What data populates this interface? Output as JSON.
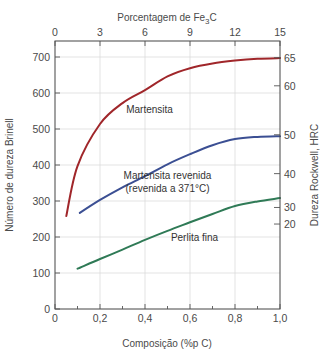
{
  "chart_data": {
    "type": "line",
    "title": "",
    "top_axis": {
      "label": "Porcentagem de Fe3C",
      "label_main": "Porcentagem de Fe",
      "label_sub": "3",
      "label_tail": "C",
      "ticks": [
        0,
        3,
        6,
        9,
        12,
        15
      ],
      "tick_labels": [
        "0",
        "3",
        "6",
        "9",
        "12",
        "15"
      ],
      "range": [
        0,
        15
      ]
    },
    "xlabel": "Composição (%p C)",
    "x_ticks": [
      0,
      0.2,
      0.4,
      0.6,
      0.8,
      1.0
    ],
    "x_tick_labels": [
      "0",
      "0,2",
      "0,4",
      "0,6",
      "0,8",
      "1,0"
    ],
    "x_minor_ticks": [
      0.1,
      0.3,
      0.5,
      0.7,
      0.9
    ],
    "xlim": [
      0,
      1.0
    ],
    "ylabel": "Número de dureza Brinell",
    "y_ticks": [
      0,
      100,
      200,
      300,
      400,
      500,
      600,
      700
    ],
    "y_tick_labels": [
      "0",
      "100",
      "200",
      "300",
      "400",
      "500",
      "600",
      "700"
    ],
    "ylim": [
      0,
      700
    ],
    "right_axis": {
      "label": "Dureza Rockwell, HRC",
      "ticks": [
        {
          "label": "65",
          "brinell": 698
        },
        {
          "label": "60",
          "brinell": 620
        },
        {
          "label": "50",
          "brinell": 484
        },
        {
          "label": "40",
          "brinell": 376
        },
        {
          "label": "30",
          "brinell": 282
        },
        {
          "label": "20",
          "brinell": 236
        }
      ]
    },
    "grid": true,
    "legend": "inline labels",
    "series": [
      {
        "name": "Martensita",
        "color": "#a0262a",
        "x": [
          0.05,
          0.1,
          0.2,
          0.3,
          0.4,
          0.5,
          0.6,
          0.7,
          0.8,
          0.9,
          1.0
        ],
        "y": [
          258,
          397,
          514,
          572,
          608,
          646,
          669,
          682,
          690,
          695,
          697
        ],
        "label_pos": {
          "x": 0.42,
          "y": 545
        }
      },
      {
        "name": "Martensita revenida (revenida a 371°C)",
        "label_line1": "Martensita revenida",
        "label_line2": "(revenida a 371°C)",
        "color": "#3b4f93",
        "x": [
          0.11,
          0.2,
          0.3,
          0.4,
          0.5,
          0.6,
          0.7,
          0.8,
          0.9,
          1.0
        ],
        "y": [
          267,
          303,
          338,
          369,
          402,
          430,
          455,
          472,
          478,
          480
        ],
        "label_pos": {
          "x": 0.5,
          "y": 360
        }
      },
      {
        "name": "Perlita fina",
        "color": "#2f7a56",
        "x": [
          0.1,
          0.2,
          0.3,
          0.4,
          0.5,
          0.6,
          0.7,
          0.8,
          0.9,
          1.0
        ],
        "y": [
          112,
          139,
          165,
          192,
          217,
          241,
          264,
          286,
          299,
          308
        ],
        "label_pos": {
          "x": 0.62,
          "y": 188
        }
      }
    ]
  }
}
